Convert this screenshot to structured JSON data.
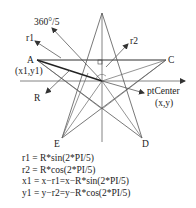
{
  "diagram": {
    "title_angle_label": "360°/5",
    "labels": {
      "r1": "r1",
      "r2": "r2",
      "A": "A",
      "A_coords": "(x1,y1)",
      "R": "R",
      "C": "C",
      "ptCenter": "ptCenter",
      "center_coords": "(x,y)",
      "E": "E",
      "D": "D"
    },
    "points": {
      "top": [
        102,
        13
      ],
      "A": [
        37,
        60
      ],
      "C": [
        166,
        60
      ],
      "D": [
        142,
        138
      ],
      "E": [
        62,
        138
      ],
      "center": [
        102,
        81
      ]
    },
    "line_color": "#555555",
    "accent_line_color": "#222222"
  },
  "formulas": [
    "r1 = R*sin(2*PI/5)",
    "r2 = R*cos(2*PI/5)",
    "x1 = x−r1=x−R*sin(2*PI/5)",
    "y1 = y−r2=y−R*cos(2*PI/5)"
  ]
}
